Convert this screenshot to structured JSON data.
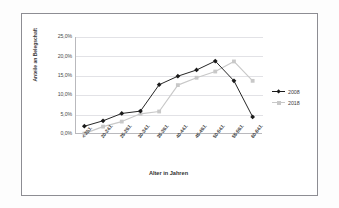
{
  "chart": {
    "title": "",
    "xlabel": "Alter in Jahren",
    "ylabel": "Anteile an Belegschaft"
  },
  "legend": {
    "items": [
      {
        "label": "2008",
        "color": "#1a1a1a",
        "marker": "diamond"
      },
      {
        "label": "2018",
        "color": "#c8c8c8",
        "marker": "square"
      }
    ]
  },
  "yaxis": {
    "ticks": [
      "25,0%",
      "20,0%",
      "15,0%",
      "10,0%",
      "5,0%",
      "0,0%"
    ]
  },
  "chart_data": {
    "type": "line",
    "title": "",
    "xlabel": "Alter in Jahren",
    "ylabel": "Anteile an Belegschaft",
    "ylim": [
      0,
      25
    ],
    "ytick_values": [
      0,
      5,
      10,
      15,
      20,
      25
    ],
    "ytick_labels": [
      "0,0%",
      "5,0%",
      "10,0%",
      "15,0%",
      "20,0%",
      "25,0%"
    ],
    "grid": true,
    "legend_position": "right",
    "categories": [
      "< 20J.",
      "20-24J.",
      "25-29J.",
      "30-34J.",
      "35-39J.",
      "40-44J.",
      "45-49J.",
      "50-54J.",
      "55-59J.",
      "60-64J."
    ],
    "series": [
      {
        "name": "2008",
        "color": "#1a1a1a",
        "marker": "diamond",
        "values": [
          2.0,
          3.4,
          5.3,
          5.9,
          12.7,
          14.9,
          16.5,
          18.8,
          13.7,
          4.4
        ]
      },
      {
        "name": "2018",
        "color": "#c8c8c8",
        "marker": "square",
        "values": [
          0.1,
          1.9,
          3.2,
          5.2,
          5.8,
          12.6,
          14.5,
          16.1,
          18.7,
          13.7
        ]
      }
    ]
  }
}
